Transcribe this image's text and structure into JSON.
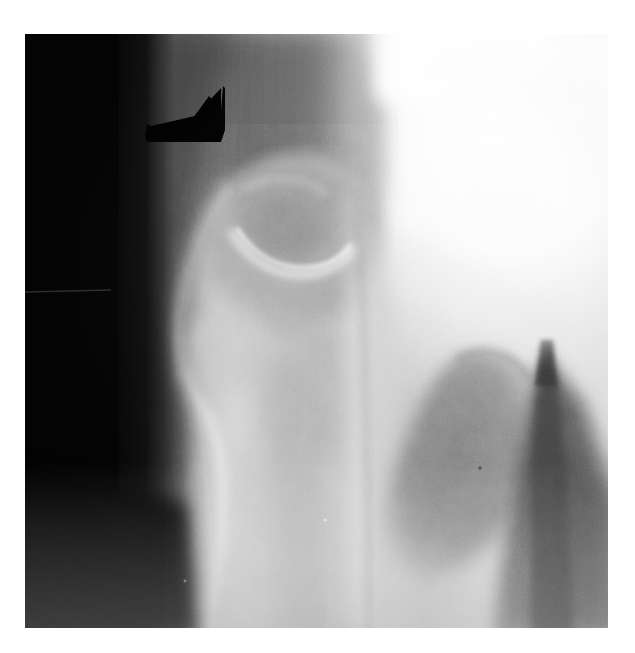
{
  "figure": {
    "kind": "radiograph",
    "modality": "X-ray",
    "view": "Anteroposterior (AP) proximal femur / hip",
    "caption": "",
    "background_color": "#ffffff",
    "plate": {
      "x": 25,
      "y": 34,
      "width": 583,
      "height": 594,
      "base_color": "#050505"
    }
  },
  "annotations": [
    {
      "id": "arrow-marker",
      "type": "arrow",
      "color": "#000000",
      "label": "",
      "points_to": "lytic-lesion-greater-trochanter",
      "x": 145,
      "y": 84,
      "width": 80,
      "height": 58
    }
  ],
  "regions": {
    "background_left_band": {
      "name": "unexposed background (lateral)",
      "tone": "#040404"
    },
    "soft_tissue_lateral": {
      "name": "lateral soft tissue shadow",
      "tone": "#3a3a3a"
    },
    "greater_trochanter": {
      "name": "greater trochanter",
      "tone": "#9d9d9d"
    },
    "lytic_lesion": {
      "name": "lytic lesion with sclerotic rim",
      "tone": "#8a8a8a"
    },
    "femoral_shaft": {
      "name": "proximal femoral shaft",
      "tone": "#c2c2c2"
    },
    "medial_cortex": {
      "name": "medial cortex / calcar",
      "tone": "#d8d8d8"
    },
    "femoral_head_acetabulum": {
      "name": "femoral head and acetabulum (overexposed)",
      "tone": "#f4f4f4"
    },
    "lesser_trochanter_shadow": {
      "name": "lesser trochanter and medial soft tissue",
      "tone": "#7e7e7e"
    },
    "ischium_shadow": {
      "name": "ischial / gluteal soft tissue shadow",
      "tone": "#5a5a5a"
    }
  }
}
